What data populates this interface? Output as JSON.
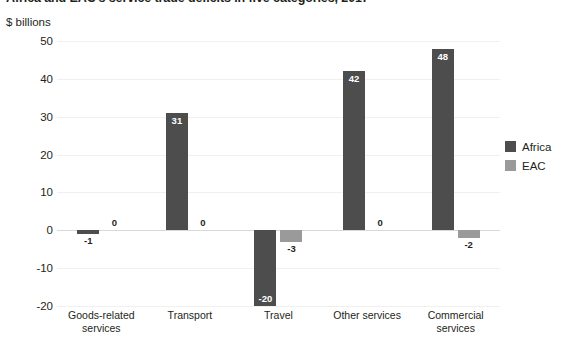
{
  "chart_data": {
    "type": "bar",
    "title": "Africa and EAC's service trade deficits in five categories, 2017",
    "axis_caption": "$ billions",
    "xlabel": "",
    "ylabel": "$ billions",
    "ylim": [
      -20,
      50
    ],
    "yticks": [
      50,
      40,
      30,
      20,
      10,
      0,
      -10,
      -20
    ],
    "ytick_labels": [
      "50",
      "40",
      "30",
      "20",
      "10",
      "0",
      "-10",
      "-20"
    ],
    "grid": true,
    "legend_position": "right",
    "categories": [
      "Goods-related services",
      "Transport",
      "Travel",
      "Other services",
      "Commercial services"
    ],
    "series": [
      {
        "name": "Africa",
        "color": "#4d4d4d",
        "values": [
          -1,
          31,
          -20,
          42,
          48
        ],
        "labels": [
          "-1",
          "31",
          "-20",
          "42",
          "48"
        ]
      },
      {
        "name": "EAC",
        "color": "#9a9a9a",
        "values": [
          0,
          0,
          -3,
          0,
          -2
        ],
        "labels": [
          "0",
          "0",
          "-3",
          "0",
          "-2"
        ]
      }
    ]
  },
  "legend": {
    "items": [
      {
        "label": "Africa",
        "color": "#4d4d4d"
      },
      {
        "label": "EAC",
        "color": "#9a9a9a"
      }
    ]
  },
  "colors": {
    "africa": "#4d4d4d",
    "eac": "#9a9a9a",
    "gridline": "#f0f0f0",
    "zeroline": "#d8d8d8",
    "text": "#231f20",
    "background": "#ffffff"
  }
}
